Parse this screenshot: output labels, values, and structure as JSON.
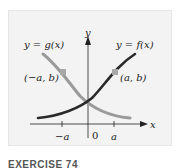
{
  "figure": {
    "labels": {
      "g_curve": "y = g(x)",
      "f_curve": "y = f(x)",
      "point_left": "(−a, b)",
      "point_right": "(a, b)",
      "y_axis": "y",
      "x_axis": "x",
      "tick_neg_a": "−a",
      "tick_zero": "0",
      "tick_a": "a"
    },
    "colors": {
      "f_curve": "#2a2a2a",
      "g_curve": "#9a9a9a",
      "marker": "#a8a8a8",
      "axis": "#222222",
      "background": "#f3f3f3"
    }
  },
  "caption": "EXERCISE 74"
}
